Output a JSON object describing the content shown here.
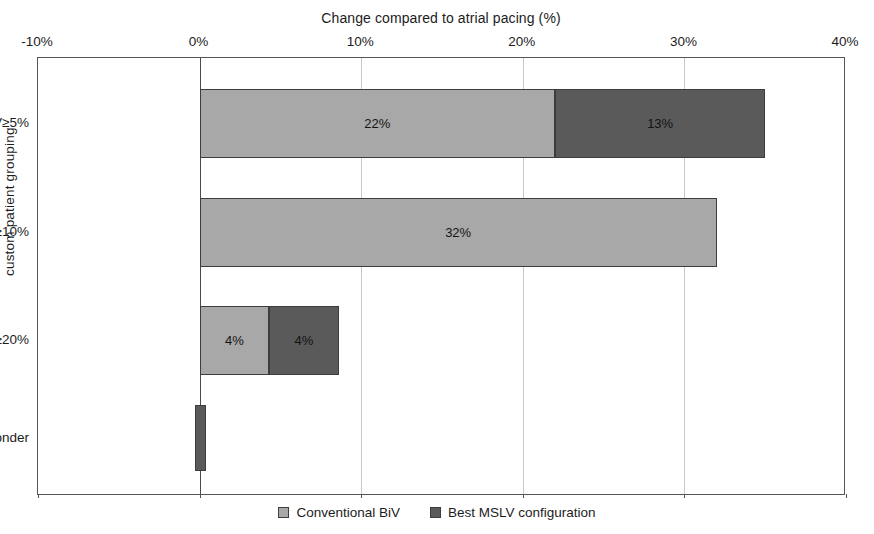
{
  "chart_data": {
    "type": "bar",
    "orientation": "horizontal",
    "stacked": true,
    "title": "Change compared to atrial pacing (%)",
    "xlabel": "Change compared to atrial pacing (%)",
    "ylabel": "custom patient grouping",
    "xlim": [
      -10,
      40
    ],
    "xticks": [
      -10,
      0,
      10,
      20,
      30,
      40
    ],
    "xtick_labels": [
      "-10%",
      "0%",
      "10%",
      "20%",
      "30%",
      "40%"
    ],
    "grid": true,
    "grid_axis": "x",
    "legend_position": "bottom",
    "categories": [
      "BiV≥10%, MSLV≥5%",
      "BiV≥10%",
      "Relative MSLV≥20%",
      "Non-responder"
    ],
    "series": [
      {
        "name": "Conventional BiV",
        "color": "#a8a8a8",
        "values": [
          22,
          32,
          4,
          0
        ],
        "labels": [
          "22%",
          "32%",
          "4%",
          ""
        ]
      },
      {
        "name": "Best MSLV configuration",
        "color": "#5a5a5a",
        "values": [
          13,
          0,
          4,
          0
        ],
        "labels": [
          "13%",
          "",
          "4%",
          ""
        ]
      }
    ],
    "bars": [
      {
        "category": "BiV≥10%, MSLV≥5%",
        "segments": [
          {
            "series": "Conventional BiV",
            "start": 0,
            "end": 22,
            "label": "22%",
            "tone": "light"
          },
          {
            "series": "Best MSLV configuration",
            "start": 22,
            "end": 35,
            "label": "13%",
            "tone": "dark"
          }
        ]
      },
      {
        "category": "BiV≥10%",
        "segments": [
          {
            "series": "Conventional BiV",
            "start": 0,
            "end": 32,
            "label": "32%",
            "tone": "light"
          }
        ]
      },
      {
        "category": "Relative MSLV≥20%",
        "segments": [
          {
            "series": "Conventional BiV",
            "start": 0,
            "end": 4.3,
            "label": "4%",
            "tone": "light"
          },
          {
            "series": "Best MSLV configuration",
            "start": 4.3,
            "end": 8.6,
            "label": "4%",
            "tone": "dark"
          }
        ]
      },
      {
        "category": "Non-responder",
        "segments": [
          {
            "series": "Best MSLV configuration",
            "start": -0.3,
            "end": 0.4,
            "label": "",
            "tone": "dark"
          }
        ]
      }
    ]
  },
  "legend": {
    "items": [
      {
        "label": "Conventional BiV",
        "tone": "light"
      },
      {
        "label": "Best MSLV configuration",
        "tone": "dark"
      }
    ]
  }
}
